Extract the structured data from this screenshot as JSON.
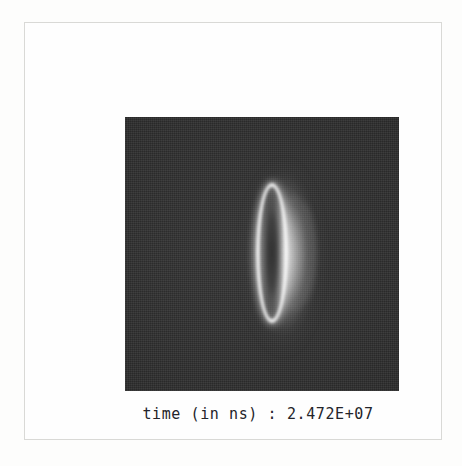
{
  "page": {
    "background_color": "#fdfdfc",
    "frame_border_color": "#d9d9d6"
  },
  "figure": {
    "name": "simulation-snapshot",
    "field": {
      "background_color": "#2b2b2b",
      "highlight_color": "#fcfcfc",
      "core_color": "#282828",
      "width_px": 274,
      "height_px": 274
    },
    "structure": {
      "label": "plasma-ring",
      "shape": "vertically-elongated-ellipse-ring",
      "center_x_px": 147,
      "center_y_px": 136,
      "semi_axis_x_px": 16,
      "semi_axis_y_px": 70
    }
  },
  "caption": {
    "label": "time (in ns) :",
    "value": "2.472E+07",
    "full_text": "time (in ns) : 2.472E+07"
  }
}
